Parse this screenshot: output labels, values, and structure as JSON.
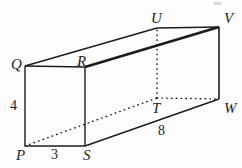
{
  "figure": {
    "kind": "rectangular-prism-diagram",
    "background_color": "#fdfdfd",
    "stroke_color": "#1c1c1c",
    "vertices": [
      {
        "id": "P",
        "label": "P",
        "x": 25,
        "y": 146,
        "label_x": 16,
        "label_y": 148,
        "hidden": false
      },
      {
        "id": "Q",
        "label": "Q",
        "x": 25,
        "y": 66,
        "label_x": 11,
        "label_y": 57,
        "hidden": false
      },
      {
        "id": "R",
        "label": "R",
        "x": 85,
        "y": 67,
        "label_x": 77,
        "label_y": 54,
        "hidden": false
      },
      {
        "id": "S",
        "label": "S",
        "x": 85,
        "y": 146,
        "label_x": 83,
        "label_y": 148,
        "hidden": false
      },
      {
        "id": "T",
        "label": "T",
        "x": 157,
        "y": 98,
        "label_x": 152,
        "label_y": 101,
        "hidden": true
      },
      {
        "id": "U",
        "label": "U",
        "x": 157,
        "y": 28,
        "label_x": 151,
        "label_y": 11,
        "hidden": true
      },
      {
        "id": "V",
        "label": "V",
        "x": 219,
        "y": 27,
        "label_x": 224,
        "label_y": 11,
        "hidden": false
      },
      {
        "id": "W",
        "label": "W",
        "x": 219,
        "y": 99,
        "label_x": 224,
        "label_y": 101,
        "hidden": false
      }
    ],
    "edges": [
      {
        "from": "P",
        "to": "Q",
        "style": "solid",
        "weight": 1.4
      },
      {
        "from": "Q",
        "to": "R",
        "style": "solid",
        "weight": 1.4
      },
      {
        "from": "R",
        "to": "S",
        "style": "solid",
        "weight": 1.4
      },
      {
        "from": "S",
        "to": "P",
        "style": "solid",
        "weight": 1.4
      },
      {
        "from": "Q",
        "to": "U",
        "style": "solid",
        "weight": 1.4
      },
      {
        "from": "R",
        "to": "V",
        "style": "solid",
        "weight": 2.6
      },
      {
        "from": "S",
        "to": "W",
        "style": "solid",
        "weight": 1.4
      },
      {
        "from": "U",
        "to": "V",
        "style": "solid",
        "weight": 1.4
      },
      {
        "from": "V",
        "to": "W",
        "style": "solid",
        "weight": 1.6
      },
      {
        "from": "P",
        "to": "T",
        "style": "dotted",
        "weight": 1.4
      },
      {
        "from": "T",
        "to": "U",
        "style": "dotted",
        "weight": 1.4
      },
      {
        "from": "T",
        "to": "W",
        "style": "dotted",
        "weight": 1.4
      }
    ],
    "dimension_labels": [
      {
        "id": "height",
        "text": "4",
        "x": 10,
        "y": 99,
        "edge": "PQ"
      },
      {
        "id": "width",
        "text": "3",
        "x": 51,
        "y": 148,
        "edge": "PS"
      },
      {
        "id": "depth",
        "text": "8",
        "x": 158,
        "y": 124,
        "edge": "SW"
      }
    ]
  }
}
